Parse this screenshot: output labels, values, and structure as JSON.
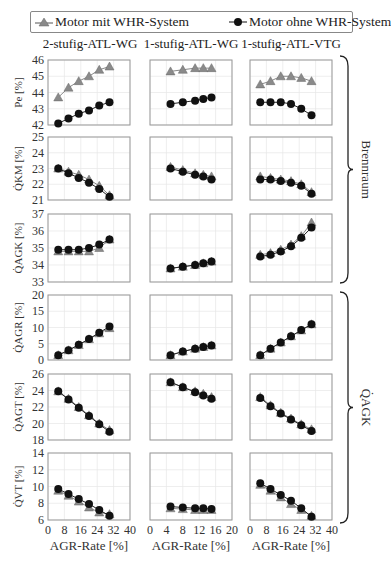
{
  "legend": {
    "items": [
      {
        "label": "Motor mit WHR-System",
        "marker": "triangle",
        "color": "#8a8a8a"
      },
      {
        "label": "Motor ohne WHR-System",
        "marker": "circle",
        "color": "#111111"
      }
    ]
  },
  "columns": [
    "2-stufig-ATL-WG",
    "1-stufig-ATL-WG",
    "1-stufig-ATL-VTG"
  ],
  "groups": [
    {
      "label": "Brennraum",
      "rows": [
        0,
        1,
        2
      ]
    },
    {
      "label": "Q̇AGK",
      "rows": [
        3,
        4,
        5
      ]
    }
  ],
  "xlabel": "AGR-Rate [%]",
  "chart_data": {
    "type": "line",
    "title": "",
    "xlabel": "AGR-Rate [%]",
    "grid": true,
    "legend_position": "top",
    "legend": [
      "Motor mit WHR-System",
      "Motor ohne WHR-System"
    ],
    "columns": [
      {
        "name": "2-stufig-ATL-WG",
        "xlim": [
          0,
          40
        ],
        "xticks": [
          0,
          8,
          16,
          24,
          32,
          40
        ],
        "x": [
          5,
          10,
          15,
          20,
          25,
          30
        ]
      },
      {
        "name": "1-stufig-ATL-WG",
        "xlim": [
          0,
          20
        ],
        "xticks": [
          0,
          4,
          8,
          12,
          16,
          20
        ],
        "x": [
          5,
          8,
          11,
          13,
          15
        ]
      },
      {
        "name": "1-stufig-ATL-VTG",
        "xlim": [
          0,
          40
        ],
        "xticks": [
          0,
          8,
          16,
          24,
          32,
          40
        ],
        "x": [
          5,
          10,
          15,
          20,
          25,
          30
        ]
      }
    ],
    "rows": [
      {
        "ylabel": "Pe [%]",
        "ylim": [
          42,
          46
        ],
        "yticks": [
          42,
          43,
          44,
          45,
          46
        ],
        "series": [
          {
            "name": "Motor mit WHR-System",
            "values": [
              [
                43.7,
                44.3,
                44.7,
                45.0,
                45.4,
                45.6
              ],
              [
                45.3,
                45.4,
                45.5,
                45.5,
                45.5
              ],
              [
                44.5,
                44.7,
                45.0,
                45.0,
                44.9,
                44.7
              ]
            ]
          },
          {
            "name": "Motor ohne WHR-System",
            "values": [
              [
                42.1,
                42.4,
                42.7,
                42.9,
                43.2,
                43.4
              ],
              [
                43.3,
                43.4,
                43.5,
                43.6,
                43.7
              ],
              [
                43.4,
                43.4,
                43.4,
                43.3,
                43.0,
                42.6
              ]
            ]
          }
        ]
      },
      {
        "ylabel": "Q̇KM [%]",
        "ylim": [
          21,
          25
        ],
        "yticks": [
          21,
          22,
          23,
          24,
          25
        ],
        "series": [
          {
            "name": "Motor mit WHR-System",
            "values": [
              [
                23.0,
                22.8,
                22.6,
                22.3,
                21.9,
                21.3
              ],
              [
                23.1,
                22.9,
                22.7,
                22.6,
                22.5
              ],
              [
                22.5,
                22.4,
                22.3,
                22.2,
                22.0,
                21.5
              ]
            ]
          },
          {
            "name": "Motor ohne WHR-System",
            "values": [
              [
                23.0,
                22.7,
                22.4,
                22.1,
                21.7,
                21.2
              ],
              [
                23.0,
                22.8,
                22.6,
                22.5,
                22.3
              ],
              [
                22.3,
                22.3,
                22.2,
                22.1,
                21.9,
                21.4
              ]
            ]
          }
        ]
      },
      {
        "ylabel": "Q̇AGK [%]",
        "ylim": [
          33,
          37
        ],
        "yticks": [
          33,
          34,
          35,
          36,
          37
        ],
        "series": [
          {
            "name": "Motor mit WHR-System",
            "values": [
              [
                34.8,
                34.8,
                34.8,
                34.8,
                35.0,
                35.5
              ],
              [
                33.8,
                33.9,
                34.0,
                34.1,
                34.2
              ],
              [
                34.6,
                34.7,
                34.9,
                35.2,
                35.7,
                36.5
              ]
            ]
          },
          {
            "name": "Motor ohne WHR-System",
            "values": [
              [
                34.9,
                34.9,
                34.9,
                35.0,
                35.2,
                35.5
              ],
              [
                33.8,
                33.9,
                34.0,
                34.1,
                34.2
              ],
              [
                34.5,
                34.6,
                34.8,
                35.1,
                35.6,
                36.2
              ]
            ]
          }
        ]
      },
      {
        "ylabel": "Q̇AGR [%]",
        "ylim": [
          0,
          20
        ],
        "yticks": [
          0,
          5,
          10,
          15,
          20
        ],
        "series": [
          {
            "name": "Motor mit WHR-System",
            "values": [
              [
                1.5,
                3.0,
                4.6,
                6.4,
                8.2,
                9.8
              ],
              [
                1.5,
                2.6,
                3.5,
                4.0,
                4.5
              ],
              [
                1.5,
                3.5,
                5.4,
                7.3,
                9.1,
                11.0
              ]
            ]
          },
          {
            "name": "Motor ohne WHR-System",
            "values": [
              [
                1.5,
                3.0,
                4.7,
                6.5,
                8.4,
                10.3
              ],
              [
                1.5,
                2.6,
                3.5,
                4.0,
                4.5
              ],
              [
                1.5,
                3.5,
                5.4,
                7.3,
                9.2,
                11.0
              ]
            ]
          }
        ]
      },
      {
        "ylabel": "Q̇AGT [%]",
        "ylim": [
          18,
          26
        ],
        "yticks": [
          18,
          20,
          22,
          24,
          26
        ],
        "series": [
          {
            "name": "Motor mit WHR-System",
            "values": [
              [
                23.9,
                23.0,
                22.0,
                21.0,
                20.0,
                19.2
              ],
              [
                25.0,
                24.4,
                23.9,
                23.6,
                23.2
              ],
              [
                23.2,
                22.2,
                21.3,
                20.6,
                19.9,
                19.3
              ]
            ]
          },
          {
            "name": "Motor ohne WHR-System",
            "values": [
              [
                23.9,
                22.9,
                21.9,
                20.9,
                19.9,
                19.0
              ],
              [
                25.0,
                24.4,
                23.8,
                23.4,
                23.0
              ],
              [
                23.1,
                22.1,
                21.2,
                20.5,
                19.8,
                19.1
              ]
            ]
          }
        ]
      },
      {
        "ylabel": "Q̇VT [%]",
        "ylim": [
          6,
          14
        ],
        "yticks": [
          6,
          8,
          10,
          12,
          14
        ],
        "series": [
          {
            "name": "Motor mit WHR-System",
            "values": [
              [
                9.5,
                8.9,
                8.2,
                7.5,
                6.9,
                6.7
              ],
              [
                7.4,
                7.3,
                7.2,
                7.2,
                7.2
              ],
              [
                10.2,
                9.5,
                8.7,
                7.9,
                7.2,
                6.5
              ]
            ]
          },
          {
            "name": "Motor ohne WHR-System",
            "values": [
              [
                9.7,
                9.1,
                8.5,
                7.9,
                7.2,
                6.5
              ],
              [
                7.6,
                7.5,
                7.4,
                7.4,
                7.3
              ],
              [
                10.4,
                9.7,
                9.0,
                8.3,
                7.4,
                6.4
              ]
            ]
          }
        ]
      }
    ]
  }
}
